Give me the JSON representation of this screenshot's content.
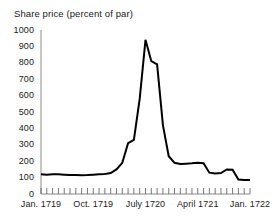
{
  "chart_data": {
    "type": "line",
    "title": "Share price (percent of par)",
    "xlabel": "",
    "ylabel": "",
    "ylim": [
      0,
      1000
    ],
    "ytick_values": [
      0,
      100,
      200,
      300,
      400,
      500,
      600,
      700,
      800,
      900,
      1000
    ],
    "ytick_labels": [
      "0",
      "100",
      "200",
      "300",
      "400",
      "500",
      "600",
      "700",
      "800",
      "900",
      "1000"
    ],
    "xtick_labels": [
      "Jan. 1719",
      "Oct. 1719",
      "July 1720",
      "April 1721",
      "Jan. 1722"
    ],
    "xtick_label_index": [
      0,
      9,
      18,
      27,
      36
    ],
    "grid": false,
    "legend": null,
    "minor_tick_count": 37,
    "line_color": "#000000",
    "line_width": 2.0,
    "x": [
      "Jan. 1719",
      "Feb. 1719",
      "Mar. 1719",
      "Apr. 1719",
      "May 1719",
      "June 1719",
      "July 1719",
      "Aug. 1719",
      "Sept. 1719",
      "Oct. 1719",
      "Nov. 1719",
      "Dec. 1719",
      "Jan. 1720",
      "Feb. 1720",
      "Mar. 1720",
      "Apr. 1720",
      "May 1720",
      "June 1720",
      "July 1720",
      "Aug. 1720",
      "Sept. 1720",
      "Oct. 1720",
      "Nov. 1720",
      "Dec. 1720",
      "Jan. 1721",
      "Feb. 1721",
      "Mar. 1721",
      "April 1721",
      "May 1721",
      "June 1721",
      "July 1721",
      "Aug. 1721",
      "Sept. 1721",
      "Oct. 1721",
      "Nov. 1721",
      "Dec. 1721",
      "Jan. 1722"
    ],
    "values": [
      120,
      118,
      120,
      120,
      118,
      116,
      116,
      115,
      116,
      118,
      120,
      122,
      128,
      150,
      190,
      310,
      330,
      580,
      940,
      810,
      790,
      420,
      230,
      190,
      183,
      185,
      187,
      190,
      188,
      130,
      125,
      128,
      150,
      148,
      88,
      85,
      85
    ]
  }
}
